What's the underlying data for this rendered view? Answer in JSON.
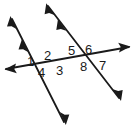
{
  "figure": {
    "kind": "geometry-diagram",
    "background_color": "#ffffff",
    "stroke_color": "#1a1a1a",
    "label_color": "#1a1a1a",
    "canvas": {
      "width": 133,
      "height": 131
    }
  },
  "lines": {
    "transversal": {
      "name": "transversal-line",
      "x1": 6,
      "y1": 69,
      "x2": 129,
      "y2": 47,
      "arrow_start": true,
      "arrow_end": true,
      "parallel_ticks": 0
    },
    "parallel_left": {
      "name": "parallel-line-left",
      "x1": 11,
      "y1": 17,
      "x2": 65,
      "y2": 124,
      "arrow_start": true,
      "arrow_end": true,
      "parallel_ticks": 1
    },
    "parallel_right": {
      "name": "parallel-line-right",
      "x1": 47,
      "y1": 4,
      "x2": 120,
      "y2": 100,
      "arrow_start": true,
      "arrow_end": true,
      "parallel_ticks": 1
    }
  },
  "intersections": [
    {
      "name": "left-intersection",
      "x": 44,
      "y": 61
    },
    {
      "name": "right-intersection",
      "x": 85,
      "y": 56
    }
  ],
  "angle_labels": [
    {
      "id": "1",
      "text": "1",
      "x": 27,
      "y": 55,
      "intersection": "left-intersection",
      "position": "upper-left"
    },
    {
      "id": "2",
      "text": "2",
      "x": 44,
      "y": 49,
      "intersection": "left-intersection",
      "position": "upper-right"
    },
    {
      "id": "3",
      "text": "3",
      "x": 56,
      "y": 64,
      "intersection": "left-intersection",
      "position": "lower-right"
    },
    {
      "id": "4",
      "text": "4",
      "x": 38,
      "y": 66,
      "intersection": "left-intersection",
      "position": "lower-left"
    },
    {
      "id": "5",
      "text": "5",
      "x": 68,
      "y": 44,
      "intersection": "right-intersection",
      "position": "upper-left"
    },
    {
      "id": "6",
      "text": "6",
      "x": 85,
      "y": 43,
      "intersection": "right-intersection",
      "position": "upper-right"
    },
    {
      "id": "7",
      "text": "7",
      "x": 99,
      "y": 59,
      "intersection": "right-intersection",
      "position": "lower-right"
    },
    {
      "id": "8",
      "text": "8",
      "x": 80,
      "y": 60,
      "intersection": "right-intersection",
      "position": "lower-left"
    }
  ]
}
